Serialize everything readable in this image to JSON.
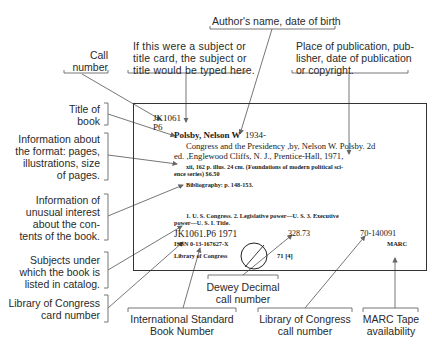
{
  "diagram": {
    "card": {
      "call_number_line1": "JK1061",
      "call_number_line2": "P6",
      "author_heading": "Polsby, Nelson W",
      "author_date": "1934-",
      "title_line1": "Congress and the Presidency ,by, Nelson W. Polsby.  2d",
      "title_line2": "ed.  ,Englewood Cliffs, N. J., Prentice-Hall, 1971,",
      "collation_line1": "xii, 162 p.  illus.  24 cm.  (Foundations of modern political sci-",
      "collation_line2": "ence series)  $6.50",
      "notes": "Bibliography: p. 148-153.",
      "tracings_line1": "1. U. S.  Congress.  2. Legislative power—U. S.  3. Executive",
      "tracings_line2": "power—U. S.    I. Title.",
      "lc_call_number": "JK1061.P6   1971",
      "isbn": "ISBN 0-13-167627-X",
      "library": "Library of Congress",
      "dewey": "328.73",
      "lc_card_number": "70-140091",
      "marc": "MARC",
      "print_code": "71 [4]"
    },
    "labels": {
      "call_number": [
        "Call",
        "number"
      ],
      "subject_title_card": [
        "If this were a subject or",
        "title card, the subject or",
        "title would be typed here."
      ],
      "author": [
        "Author's name, date of birth"
      ],
      "place_of_publication": [
        "Place of publication, pub-",
        "lisher, date of publication",
        "or copyright."
      ],
      "title_of_book": [
        "Title of",
        "book"
      ],
      "format_info": [
        "Information about",
        "the format: pages,",
        "illustrations, size",
        "of pages."
      ],
      "unusual_interest": [
        "Information of",
        "unusual interest",
        "about the con-",
        "tents of the book."
      ],
      "subjects": [
        "Subjects under",
        "which the book is",
        "listed in catalog."
      ],
      "lc_card_number": [
        "Library of Congress",
        "card number"
      ],
      "isbn": [
        "International Standard",
        "Book Number"
      ],
      "dewey": [
        "Dewey Decimal",
        "call number"
      ],
      "lc_call_number": [
        "Library of Congress",
        "call number"
      ],
      "marc": [
        "MARC Tape",
        "availability"
      ]
    },
    "colors": {
      "line": "#555555",
      "text": "#2a2a2a",
      "card_border": "#333333"
    }
  }
}
